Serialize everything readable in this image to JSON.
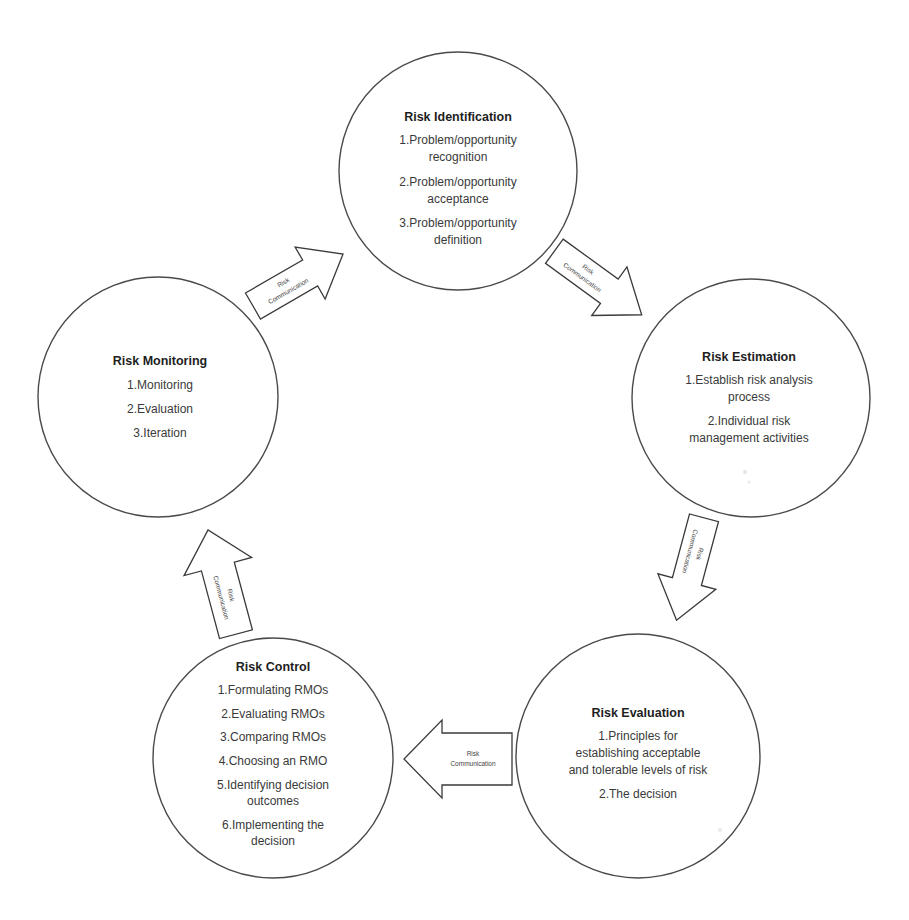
{
  "diagram": {
    "type": "cycle",
    "colors": {
      "stroke": "#4a4a4a",
      "fill": "#ffffff",
      "text": "#2a2a2a"
    },
    "nodes": [
      {
        "id": "identification",
        "title": "Risk Identification",
        "items": [
          "1.Problem/opportunity",
          "recognition",
          "2.Problem/opportunity",
          "acceptance",
          "3.Problem/opportunity",
          "definition"
        ]
      },
      {
        "id": "estimation",
        "title": "Risk Estimation",
        "items": [
          "1.Establish risk analysis",
          "process",
          "2.Individual risk",
          "management activities"
        ]
      },
      {
        "id": "evaluation",
        "title": "Risk Evaluation",
        "items": [
          "1.Principles for",
          "establishing acceptable",
          "and tolerable levels of risk",
          "2.The decision"
        ]
      },
      {
        "id": "control",
        "title": "Risk Control",
        "items": [
          "1.Formulating RMOs",
          "2.Evaluating RMOs",
          "3.Comparing RMOs",
          "4.Choosing an RMO",
          "5.Identifying decision",
          "outcomes",
          "6.Implementing the",
          "decision"
        ]
      },
      {
        "id": "monitoring",
        "title": "Risk Monitoring",
        "items": [
          "1.Monitoring",
          "2.Evaluation",
          "3.Iteration"
        ]
      }
    ],
    "arrows": [
      {
        "from": "monitoring",
        "to": "identification",
        "line1": "Risk",
        "line2": "Communication"
      },
      {
        "from": "identification",
        "to": "estimation",
        "line1": "Risk",
        "line2": "Communication"
      },
      {
        "from": "estimation",
        "to": "evaluation",
        "line1": "Risk",
        "line2": "Communication"
      },
      {
        "from": "evaluation",
        "to": "control",
        "line1": "Risk",
        "line2": "Communication"
      },
      {
        "from": "control",
        "to": "monitoring",
        "line1": "Risk",
        "line2": "Communication"
      }
    ]
  }
}
